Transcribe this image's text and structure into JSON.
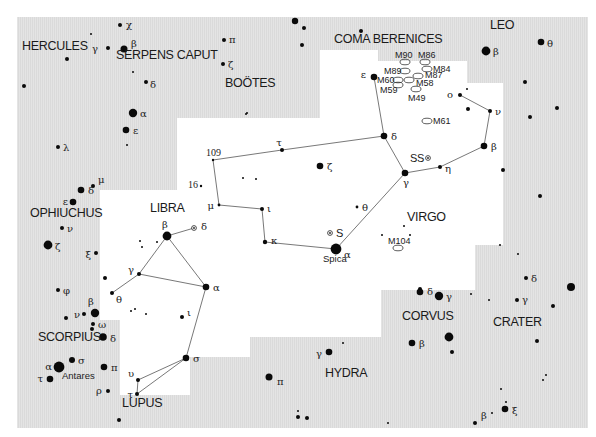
{
  "map": {
    "title": "Virgo and surrounding constellations star chart",
    "background_gray": "#e3e3e3",
    "highlight_white": "#ffffff",
    "constellations": [
      {
        "id": "hercules",
        "label": "HERCULES",
        "x": 22,
        "y": 50
      },
      {
        "id": "serpens-caput",
        "label": "SERPENS CAPUT",
        "x": 116,
        "y": 59
      },
      {
        "id": "bootes",
        "label": "BOÖTES",
        "x": 225,
        "y": 87
      },
      {
        "id": "coma-berenices",
        "label": "COMA BERENICES",
        "x": 334,
        "y": 43
      },
      {
        "id": "leo",
        "label": "LEO",
        "x": 490,
        "y": 29
      },
      {
        "id": "virgo",
        "label": "VIRGO",
        "x": 407,
        "y": 221
      },
      {
        "id": "libra",
        "label": "LIBRA",
        "x": 150,
        "y": 212
      },
      {
        "id": "ophiuchus",
        "label": "OPHIUCHUS",
        "x": 30,
        "y": 217
      },
      {
        "id": "scorpius",
        "label": "SCORPIUS",
        "x": 38,
        "y": 341
      },
      {
        "id": "lupus",
        "label": "LUPUS",
        "x": 122,
        "y": 407
      },
      {
        "id": "hydra",
        "label": "HYDRA",
        "x": 325,
        "y": 377
      },
      {
        "id": "corvus",
        "label": "CORVUS",
        "x": 402,
        "y": 320
      },
      {
        "id": "crater",
        "label": "CRATER",
        "x": 493,
        "y": 326
      }
    ],
    "galaxies": [
      {
        "label": "M90",
        "x": 405,
        "y": 62,
        "lx": 395,
        "ly": 58,
        "anchor": "start",
        "lpos": "above"
      },
      {
        "label": "M86",
        "x": 425,
        "y": 62,
        "lx": 418,
        "ly": 58
      },
      {
        "label": "M84",
        "x": 427,
        "y": 69,
        "lx": 433,
        "ly": 72
      },
      {
        "label": "M89",
        "x": 405,
        "y": 71,
        "lx": 384,
        "ly": 74
      },
      {
        "label": "M87",
        "x": 418,
        "y": 76,
        "lx": 425,
        "ly": 78
      },
      {
        "label": "M60",
        "x": 398,
        "y": 80,
        "lx": 377,
        "ly": 83
      },
      {
        "label": "M58",
        "x": 409,
        "y": 80,
        "lx": 416,
        "ly": 86
      },
      {
        "label": "M59",
        "x": 398,
        "y": 85,
        "lx": 380,
        "ly": 93
      },
      {
        "label": "M49",
        "x": 416,
        "y": 89,
        "lx": 408,
        "ly": 101
      },
      {
        "label": "M61",
        "x": 427,
        "y": 121,
        "lx": 433,
        "ly": 124
      },
      {
        "label": "M104",
        "x": 398,
        "y": 248,
        "lx": 388,
        "ly": 244
      }
    ],
    "variable_stars": [
      {
        "label": "SS",
        "x": 428,
        "y": 158,
        "lx": 410,
        "ly": 162
      },
      {
        "label": "S",
        "x": 330,
        "y": 233,
        "lx": 336,
        "ly": 237
      },
      {
        "label": "δ",
        "x": 194,
        "y": 228,
        "lx": 201,
        "ly": 230
      }
    ],
    "named_stars": [
      {
        "label": "Spica",
        "x": 323,
        "y": 262
      },
      {
        "label": "Antares",
        "x": 62,
        "y": 379
      }
    ],
    "numbered_stars": [
      {
        "label": "109",
        "x": 213,
        "y": 160,
        "lx": 206,
        "ly": 156
      },
      {
        "label": "16",
        "x": 201,
        "y": 186,
        "lx": 188,
        "ly": 188
      }
    ],
    "stars": [
      {
        "x": 295,
        "y": 21,
        "r": 3.2
      },
      {
        "x": 304,
        "y": 28,
        "r": 2
      },
      {
        "x": 361,
        "y": 31,
        "r": 2
      },
      {
        "x": 302,
        "y": 45,
        "r": 2
      },
      {
        "x": 120,
        "y": 25,
        "r": 2,
        "g": "χ",
        "gx": 126,
        "gy": 28
      },
      {
        "x": 91,
        "y": 34,
        "r": 1
      },
      {
        "x": 108,
        "y": 48,
        "r": 2,
        "g": "γ",
        "gx": 98,
        "gy": 52,
        "ganchor": "end"
      },
      {
        "x": 124,
        "y": 49,
        "r": 3.5,
        "g": "β",
        "gx": 131,
        "gy": 47
      },
      {
        "x": 67,
        "y": 59,
        "r": 2
      },
      {
        "x": 133,
        "y": 72,
        "r": 1
      },
      {
        "x": 224,
        "y": 40,
        "r": 2,
        "g": "π",
        "gx": 229,
        "gy": 43
      },
      {
        "x": 223,
        "y": 64,
        "r": 2,
        "g": "ζ",
        "gx": 228,
        "gy": 68
      },
      {
        "x": 146,
        "y": 82,
        "r": 2,
        "g": "δ",
        "gx": 150,
        "gy": 88
      },
      {
        "x": 24,
        "y": 86,
        "r": 2
      },
      {
        "x": 246,
        "y": 114,
        "r": 1
      },
      {
        "x": 133,
        "y": 113,
        "r": 4.2,
        "g": "α",
        "gx": 140,
        "gy": 117
      },
      {
        "x": 126,
        "y": 130,
        "r": 3.3,
        "g": "ε",
        "gx": 133,
        "gy": 134
      },
      {
        "x": 58,
        "y": 147,
        "r": 2,
        "g": "λ",
        "gx": 63,
        "gy": 151
      },
      {
        "x": 127,
        "y": 145,
        "r": 1
      },
      {
        "x": 486,
        "y": 51,
        "r": 4.4,
        "g": "β",
        "gx": 493,
        "gy": 55
      },
      {
        "x": 541,
        "y": 42,
        "r": 3.3,
        "g": "θ",
        "gx": 547,
        "gy": 47
      },
      {
        "x": 525,
        "y": 82,
        "r": 2
      },
      {
        "x": 557,
        "y": 108,
        "r": 2
      },
      {
        "x": 530,
        "y": 117,
        "r": 2
      },
      {
        "x": 503,
        "y": 170,
        "r": 2
      },
      {
        "x": 540,
        "y": 196,
        "r": 2
      },
      {
        "x": 460,
        "y": 95,
        "r": 2,
        "g": "o",
        "gx": 453,
        "gy": 98,
        "ganchor": "end"
      },
      {
        "x": 467,
        "y": 89,
        "r": 1
      },
      {
        "x": 468,
        "y": 109,
        "r": 2
      },
      {
        "x": 490,
        "y": 111,
        "r": 2,
        "g": "ν",
        "gx": 495,
        "gy": 115
      },
      {
        "x": 484,
        "y": 146,
        "r": 3.3,
        "g": "β",
        "gx": 491,
        "gy": 150
      },
      {
        "x": 440,
        "y": 167,
        "r": 2,
        "g": "η",
        "gx": 445,
        "gy": 172
      },
      {
        "x": 405,
        "y": 173,
        "r": 3.3,
        "g": "γ",
        "gx": 403,
        "gy": 186
      },
      {
        "x": 384,
        "y": 136,
        "r": 3.3,
        "g": "δ",
        "gx": 391,
        "gy": 140
      },
      {
        "x": 374,
        "y": 77,
        "r": 3.3,
        "g": "ε",
        "gx": 366,
        "gy": 78,
        "ganchor": "end"
      },
      {
        "x": 320,
        "y": 166,
        "r": 3.3,
        "g": "ζ",
        "gx": 327,
        "gy": 170
      },
      {
        "x": 357,
        "y": 207,
        "r": 1.4,
        "g": "θ",
        "gx": 362,
        "gy": 211
      },
      {
        "x": 336,
        "y": 249,
        "r": 5.4,
        "g": "α",
        "gx": 344,
        "gy": 258
      },
      {
        "x": 247,
        "y": 113,
        "r": 1
      },
      {
        "x": 282,
        "y": 150,
        "r": 2,
        "g": "τ",
        "gx": 279,
        "gy": 146,
        "ganchor": "middle"
      },
      {
        "x": 243,
        "y": 178,
        "r": 1
      },
      {
        "x": 256,
        "y": 179,
        "r": 1
      },
      {
        "x": 219,
        "y": 205,
        "r": 1.4,
        "g": "μ",
        "gx": 214,
        "gy": 209,
        "ganchor": "end"
      },
      {
        "x": 262,
        "y": 209,
        "r": 2,
        "g": "ι",
        "gx": 267,
        "gy": 212
      },
      {
        "x": 265,
        "y": 242,
        "r": 2.2,
        "g": "κ",
        "gx": 271,
        "gy": 244
      },
      {
        "x": 404,
        "y": 226,
        "r": 1
      },
      {
        "x": 382,
        "y": 235,
        "r": 1
      },
      {
        "x": 410,
        "y": 235,
        "r": 1
      },
      {
        "x": 167,
        "y": 236,
        "r": 4.4,
        "g": "β",
        "gx": 165,
        "gy": 228,
        "ganchor": "middle"
      },
      {
        "x": 142,
        "y": 247,
        "r": 1
      },
      {
        "x": 140,
        "y": 241,
        "r": 1
      },
      {
        "x": 157,
        "y": 242,
        "r": 1
      },
      {
        "x": 139,
        "y": 274,
        "r": 2,
        "g": "γ",
        "gx": 134,
        "gy": 273,
        "ganchor": "end"
      },
      {
        "x": 206,
        "y": 287,
        "r": 3.3,
        "g": "α",
        "gx": 213,
        "gy": 291
      },
      {
        "x": 112,
        "y": 293,
        "r": 2,
        "g": "θ",
        "gx": 116,
        "gy": 303
      },
      {
        "x": 105,
        "y": 278,
        "r": 2
      },
      {
        "x": 131,
        "y": 311,
        "r": 1
      },
      {
        "x": 135,
        "y": 309,
        "r": 1
      },
      {
        "x": 146,
        "y": 314,
        "r": 1
      },
      {
        "x": 182,
        "y": 317,
        "r": 2,
        "g": "ι",
        "gx": 187,
        "gy": 316
      },
      {
        "x": 186,
        "y": 358,
        "r": 3.3,
        "g": "σ",
        "gx": 193,
        "gy": 362
      },
      {
        "x": 138,
        "y": 380,
        "r": 2,
        "g": "υ",
        "gx": 134,
        "gy": 377,
        "ganchor": "end"
      },
      {
        "x": 137,
        "y": 394,
        "r": 2,
        "g": "τ",
        "gx": 133,
        "gy": 398,
        "ganchor": "end"
      },
      {
        "x": 93,
        "y": 186,
        "r": 2,
        "g": "μ",
        "gx": 98,
        "gy": 183
      },
      {
        "x": 81,
        "y": 190,
        "r": 3.3,
        "g": "δ",
        "gx": 88,
        "gy": 194
      },
      {
        "x": 73,
        "y": 202,
        "r": 3.3,
        "g": "ε",
        "gx": 68,
        "gy": 205,
        "ganchor": "end"
      },
      {
        "x": 62,
        "y": 228,
        "r": 2,
        "g": "ν",
        "gx": 67,
        "gy": 232
      },
      {
        "x": 48,
        "y": 245,
        "r": 4.4,
        "g": "ζ",
        "gx": 55,
        "gy": 250
      },
      {
        "x": 96,
        "y": 253,
        "r": 2,
        "g": "ξ",
        "gx": 91,
        "gy": 258,
        "ganchor": "end"
      },
      {
        "x": 58,
        "y": 290,
        "r": 2,
        "g": "φ",
        "gx": 63,
        "gy": 294
      },
      {
        "x": 66,
        "y": 318,
        "r": 2
      },
      {
        "x": 95,
        "y": 313,
        "r": 4.2,
        "g": "β",
        "gx": 91,
        "gy": 305,
        "ganchor": "middle"
      },
      {
        "x": 84,
        "y": 314,
        "r": 2,
        "g": "ν",
        "gx": 80,
        "gy": 318,
        "ganchor": "end"
      },
      {
        "x": 93,
        "y": 324,
        "r": 2,
        "g": "ω",
        "gx": 98,
        "gy": 328
      },
      {
        "x": 92,
        "y": 329,
        "r": 2
      },
      {
        "x": 103,
        "y": 337,
        "r": 3.8,
        "g": "δ",
        "gx": 110,
        "gy": 342
      },
      {
        "x": 72,
        "y": 360,
        "r": 3,
        "g": "σ",
        "gx": 78,
        "gy": 364
      },
      {
        "x": 59,
        "y": 367,
        "r": 5.4,
        "g": "α",
        "gx": 52,
        "gy": 370,
        "ganchor": "end"
      },
      {
        "x": 104,
        "y": 367,
        "r": 3.3,
        "g": "π",
        "gx": 111,
        "gy": 371
      },
      {
        "x": 50,
        "y": 379,
        "r": 3.3,
        "g": "τ",
        "gx": 43,
        "gy": 382,
        "ganchor": "end"
      },
      {
        "x": 108,
        "y": 391,
        "r": 2,
        "g": "ρ",
        "gx": 102,
        "gy": 394,
        "ganchor": "end"
      },
      {
        "x": 119,
        "y": 420,
        "r": 2
      },
      {
        "x": 269,
        "y": 377,
        "r": 3.5,
        "g": "π",
        "gx": 277,
        "gy": 385
      },
      {
        "x": 329,
        "y": 352,
        "r": 3.3,
        "g": "γ",
        "gx": 322,
        "gy": 357,
        "ganchor": "end"
      },
      {
        "x": 343,
        "y": 343,
        "r": 1
      },
      {
        "x": 298,
        "y": 411,
        "r": 1
      },
      {
        "x": 298,
        "y": 417,
        "r": 2
      },
      {
        "x": 307,
        "y": 418,
        "r": 2
      },
      {
        "x": 388,
        "y": 423,
        "r": 1
      },
      {
        "x": 420,
        "y": 289,
        "r": 2
      },
      {
        "x": 420,
        "y": 292,
        "r": 3.3,
        "g": "δ",
        "gx": 427,
        "gy": 295
      },
      {
        "x": 439,
        "y": 296,
        "r": 4.2,
        "g": "γ",
        "gx": 446,
        "gy": 300
      },
      {
        "x": 471,
        "y": 294,
        "r": 1
      },
      {
        "x": 489,
        "y": 300,
        "r": 1
      },
      {
        "x": 526,
        "y": 278,
        "r": 2,
        "g": "δ",
        "gx": 531,
        "gy": 282
      },
      {
        "x": 517,
        "y": 300,
        "r": 2,
        "g": "γ",
        "gx": 522,
        "gy": 303
      },
      {
        "x": 571,
        "y": 287,
        "r": 4
      },
      {
        "x": 553,
        "y": 306,
        "r": 2
      },
      {
        "x": 412,
        "y": 343,
        "r": 3.3,
        "g": "β",
        "gx": 419,
        "gy": 347
      },
      {
        "x": 449,
        "y": 337,
        "r": 4.4
      },
      {
        "x": 452,
        "y": 352,
        "r": 2
      },
      {
        "x": 537,
        "y": 341,
        "r": 2
      },
      {
        "x": 500,
        "y": 245,
        "r": 1
      },
      {
        "x": 518,
        "y": 254,
        "r": 1
      },
      {
        "x": 546,
        "y": 375,
        "r": 1
      },
      {
        "x": 543,
        "y": 380,
        "r": 1
      },
      {
        "x": 501,
        "y": 389,
        "r": 1
      },
      {
        "x": 506,
        "y": 402,
        "r": 1
      },
      {
        "x": 505,
        "y": 409,
        "r": 3.3,
        "g": "ξ",
        "gx": 512,
        "gy": 414
      },
      {
        "x": 492,
        "y": 413,
        "r": 1
      },
      {
        "x": 475,
        "y": 423,
        "r": 2,
        "g": "β",
        "gx": 481,
        "gy": 419
      }
    ],
    "constellation_lines": [
      {
        "name": "virgo",
        "points": [
          [
            213,
            160
          ],
          [
            282,
            150
          ],
          [
            384,
            136
          ],
          [
            374,
            77
          ]
        ]
      },
      {
        "name": "virgo-spine",
        "points": [
          [
            384,
            136
          ],
          [
            405,
            173
          ],
          [
            440,
            167
          ],
          [
            484,
            146
          ],
          [
            490,
            111
          ],
          [
            460,
            95
          ]
        ]
      },
      {
        "name": "virgo-south",
        "points": [
          [
            405,
            173
          ],
          [
            336,
            249
          ],
          [
            265,
            242
          ],
          [
            262,
            209
          ],
          [
            219,
            205
          ],
          [
            213,
            160
          ]
        ]
      },
      {
        "name": "libra",
        "points": [
          [
            167,
            236
          ],
          [
            139,
            274
          ],
          [
            206,
            287
          ],
          [
            167,
            236
          ]
        ]
      },
      {
        "name": "libra-delta",
        "points": [
          [
            167,
            236
          ],
          [
            194,
            228
          ]
        ]
      },
      {
        "name": "libra-theta",
        "points": [
          [
            139,
            274
          ],
          [
            112,
            293
          ]
        ]
      },
      {
        "name": "libra-south",
        "points": [
          [
            206,
            287
          ],
          [
            186,
            358
          ],
          [
            138,
            380
          ],
          [
            137,
            394
          ],
          [
            186,
            358
          ]
        ]
      }
    ]
  }
}
